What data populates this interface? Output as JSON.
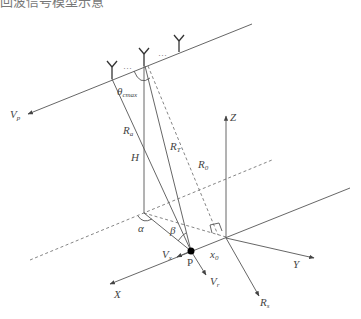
{
  "caption_partial": "回波信号模型示意",
  "labels": {
    "vp": "V",
    "vp_sub": "p",
    "theta": "θ",
    "theta_sub": "cmax",
    "ra": "R",
    "ra_sub": "a",
    "rt": "R",
    "rt_sub": "T",
    "r0": "R",
    "r0_sub": "0",
    "h": "H",
    "z": "Z",
    "alpha": "α",
    "beta": "β",
    "vx": "V",
    "vx_sub": "x",
    "p": "P",
    "x0": "x",
    "x0_sub": "0",
    "vr": "V",
    "vr_sub": "r",
    "x": "X",
    "y": "Y",
    "rs": "R",
    "rs_sub": "s",
    "dots": "···"
  },
  "colors": {
    "line": "#555555",
    "antenna": "#333333",
    "point": "#000000"
  }
}
